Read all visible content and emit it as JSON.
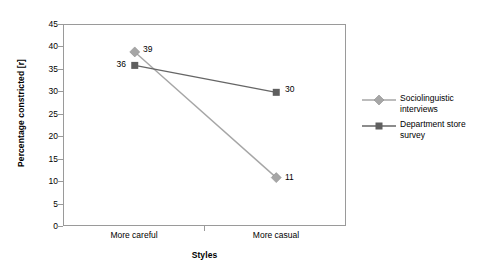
{
  "chart_data": {
    "type": "line",
    "title": "",
    "xlabel": "Styles",
    "ylabel": "Percentage constricted [r]",
    "categories": [
      "More careful",
      "More casual"
    ],
    "ylim": [
      0,
      45
    ],
    "yticks": [
      0,
      5,
      10,
      15,
      20,
      25,
      30,
      35,
      40,
      45
    ],
    "ytick_labels": [
      "0",
      "5",
      "10",
      "15",
      "20",
      "25",
      "30",
      "35",
      "40",
      "45"
    ],
    "grid": false,
    "legend_position": "right",
    "series": [
      {
        "name": "Sociolinguistic interviews",
        "marker": "diamond",
        "color": "#a6a6a6",
        "values": [
          39,
          11
        ],
        "data_labels": [
          "39",
          "11"
        ],
        "label_side": [
          "right",
          "right"
        ]
      },
      {
        "name": "Department store survey",
        "marker": "square",
        "color": "#666666",
        "values": [
          36,
          30
        ],
        "data_labels": [
          "36",
          "30"
        ],
        "label_side": [
          "left",
          "right"
        ]
      }
    ]
  },
  "axes": {
    "frame_color": "#9a9a9a",
    "tick_color": "#9a9a9a"
  },
  "legend": {
    "entries": [
      {
        "label_line1": "Sociolinguistic",
        "label_line2": "interviews",
        "marker": "diamond-icon",
        "color": "#a6a6a6"
      },
      {
        "label_line1": "Department store",
        "label_line2": "survey",
        "marker": "square-icon",
        "color": "#666666"
      }
    ]
  }
}
